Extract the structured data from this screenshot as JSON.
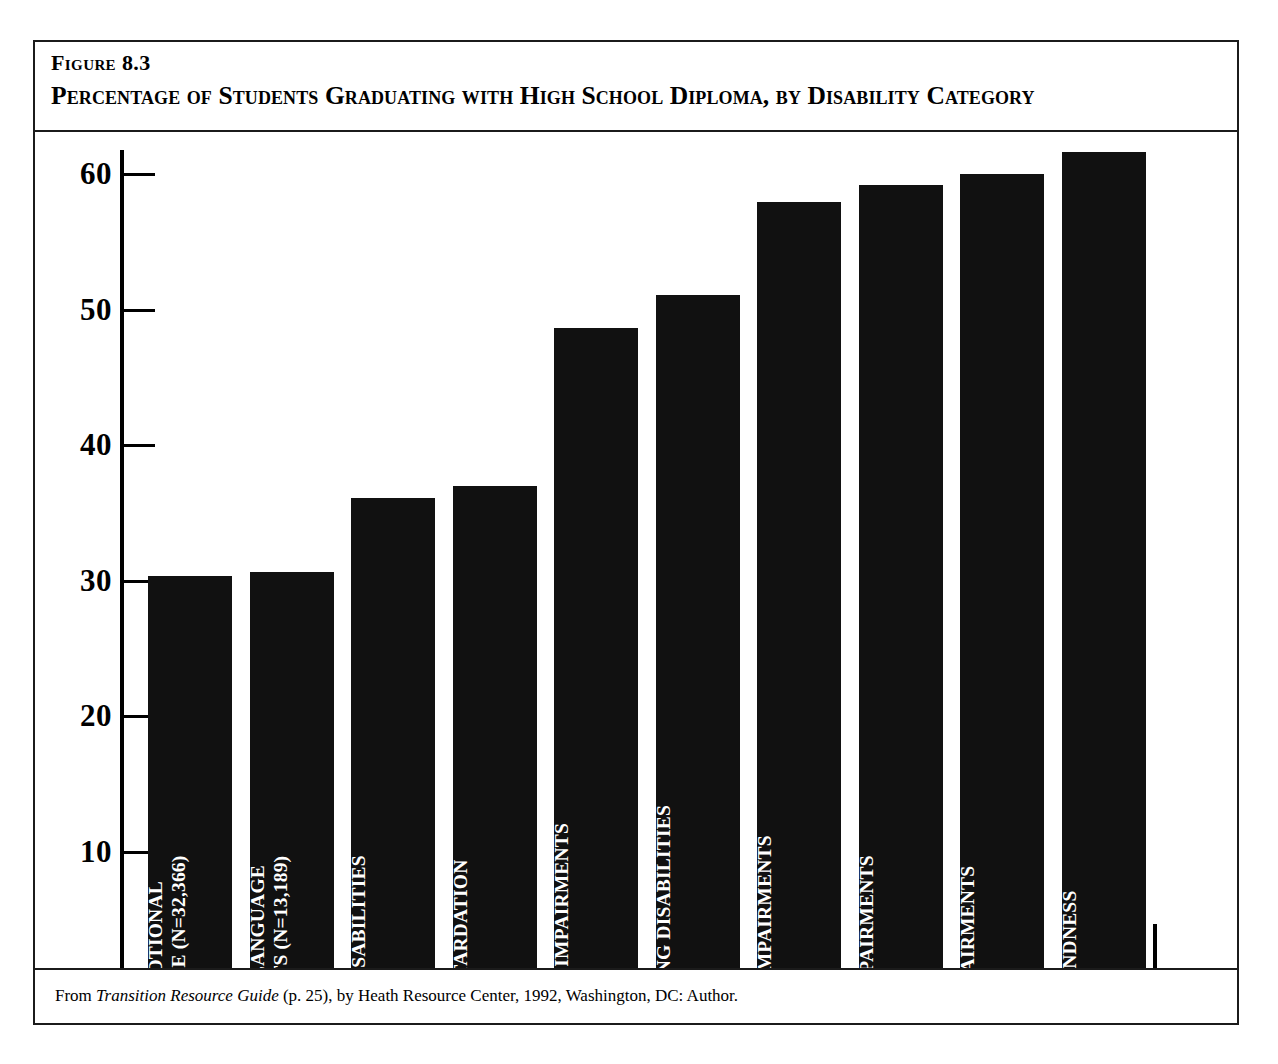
{
  "figure": {
    "number": "Figure 8.3",
    "title": "Percentage of Students Graduating with High School Diploma, by Disability Category",
    "caption_prefix": "From ",
    "caption_italic": "Transition Resource Guide",
    "caption_suffix": " (p. 25), by Heath Resource Center, 1992, Washington, DC: Author."
  },
  "chart_data": {
    "type": "bar",
    "title": "Percentage of Students Graduating with High School Diploma, by Disability Category",
    "xlabel": "",
    "ylabel": "",
    "ylim": [
      0,
      64
    ],
    "yticks": [
      0,
      10,
      20,
      30,
      40,
      50,
      60
    ],
    "grid": false,
    "legend": false,
    "orientation": "vertical",
    "bar_color": "#111111",
    "categories": [
      "Serious Emotional Disturbance",
      "Speech or Language Impairments",
      "Multiple Disabilities",
      "Mental Retardation",
      "Other Health Impairments",
      "Specific Learning Disabilities",
      "Orthopedic Impairments",
      "Hearing Impairments",
      "Visual Impairments",
      "Deaf-Blindness"
    ],
    "values": [
      30.3,
      30.6,
      36.1,
      37.0,
      48.6,
      51.1,
      57.9,
      59.2,
      60.0,
      61.6
    ],
    "n_values": [
      "32,366",
      "13,189",
      "4,048",
      "45,051",
      "2,937",
      "126,495",
      "2,464",
      "3,233",
      "1,482",
      "153"
    ],
    "bars": [
      {
        "label_line1": "SERIOUS EMOTIONAL",
        "label_line2": "DISTURBANCE   (N=32,366)",
        "value": 30.3
      },
      {
        "label_line1": "SPEECH OR LANGUAGE",
        "label_line2": "IMPAIRMENTS   (N=13,189)",
        "value": 30.6
      },
      {
        "label_line1": "MULTIPLE DISABILITIES",
        "label_line2": "(N=4,048)",
        "value": 36.1
      },
      {
        "label_line1": "MENTAL RETARDATION",
        "label_line2": "(N=45,051)",
        "value": 37.0
      },
      {
        "label_line1": "OTHER HEALTH IMPAIRMENTS",
        "label_line2": "(N=2,937)",
        "value": 48.6
      },
      {
        "label_line1": "SPECIFIC LEARNING DISABILITIES",
        "label_line2": "(N=126,495)",
        "value": 51.1
      },
      {
        "label_line1": "ORTHOPEDIC IMPAIRMENTS",
        "label_line2": "(N=2,464)",
        "value": 57.9
      },
      {
        "label_line1": "HEARING IMPAIRMENTS",
        "label_line2": "(N=3,233)",
        "value": 59.2
      },
      {
        "label_line1": "VISUAL IMPAIRMENTS",
        "label_line2": "(N=1,482)",
        "value": 60.0
      },
      {
        "label_line1": "DEAF-BLINDNESS",
        "label_line2": "(N=153)",
        "value": 61.6
      }
    ]
  },
  "axis": {
    "tick_labels": [
      "60",
      "50",
      "40",
      "30",
      "20",
      "10",
      "0"
    ]
  }
}
